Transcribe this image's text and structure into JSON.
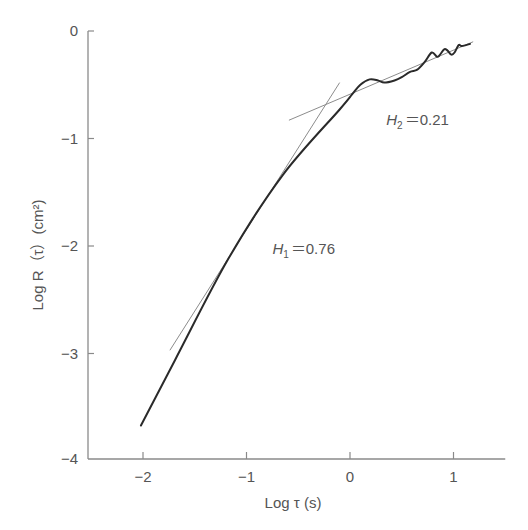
{
  "chart_data": {
    "type": "line",
    "title": "",
    "xlabel": "Log τ (s)",
    "ylabel": "Log R（τ）(cm²)",
    "xlim": [
      -2.53,
      1.5
    ],
    "ylim": [
      -4,
      0
    ],
    "grid": false,
    "legend": null,
    "x_ticks": [
      -2,
      -1,
      0,
      1
    ],
    "x_tick_labels": [
      "−2",
      "−1",
      "0",
      "1"
    ],
    "y_ticks": [
      0,
      -1,
      -2,
      -3,
      -4
    ],
    "y_tick_labels": [
      "0",
      "−1",
      "−2",
      "−3",
      "−4"
    ],
    "series": [
      {
        "name": "R(τ) curve",
        "style": "thick-dark",
        "x": [
          -2.02,
          -1.69,
          -1.17,
          -0.65,
          -0.1,
          0.02,
          0.1,
          0.19,
          0.27,
          0.33,
          0.43,
          0.5,
          0.58,
          0.65,
          0.72,
          0.79,
          0.84,
          0.87,
          0.91,
          0.94,
          0.98,
          1.01,
          1.05,
          1.08,
          1.16
        ],
        "y": [
          -3.67,
          -3.06,
          -2.11,
          -1.34,
          -0.73,
          -0.59,
          -0.5,
          -0.45,
          -0.46,
          -0.48,
          -0.46,
          -0.43,
          -0.38,
          -0.36,
          -0.29,
          -0.2,
          -0.24,
          -0.22,
          -0.17,
          -0.18,
          -0.22,
          -0.2,
          -0.13,
          -0.14,
          -0.12
        ]
      },
      {
        "name": "H1 fit line",
        "style": "thin-gray",
        "x": [
          -1.74,
          -0.1
        ],
        "y": [
          -2.97,
          -0.48
        ]
      },
      {
        "name": "H2 fit line",
        "style": "thin-gray",
        "x": [
          -0.59,
          1.19
        ],
        "y": [
          -0.83,
          -0.1
        ]
      }
    ],
    "annotations": [
      {
        "text_main": "H",
        "text_sub": "1",
        "text_rest": "＝0.76",
        "x": -0.75,
        "y": -2.07
      },
      {
        "text_main": "H",
        "text_sub": "2",
        "text_rest": "＝0.21",
        "x": 0.35,
        "y": -0.87
      }
    ]
  },
  "axes": {
    "x_label": "Log τ (s)",
    "y_label": "Log R（τ）(cm²)"
  },
  "colors": {
    "axis": "#8a8a8a",
    "curve": "#2a2a2a",
    "fit_line": "#8c8c8c",
    "text": "#555555"
  }
}
